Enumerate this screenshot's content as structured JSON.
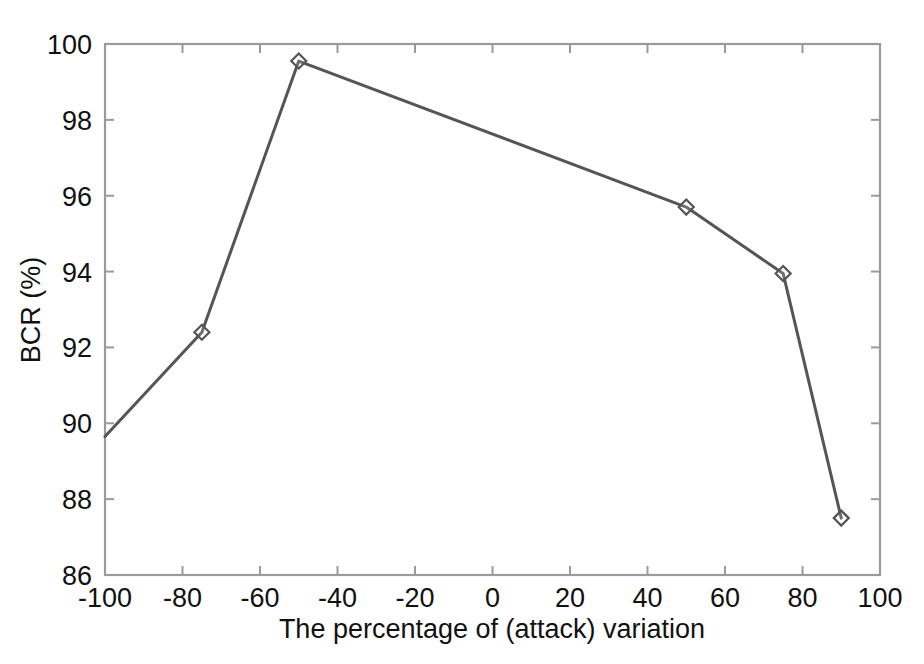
{
  "figure": {
    "background_color": "#ffffff",
    "axes_color": "#9a9a9a",
    "series_color": "#555555",
    "text_color": "#111111"
  },
  "chart_data": {
    "type": "line",
    "title": "",
    "subtitle": "",
    "xlabel": "The percentage of (attack) variation",
    "ylabel": "BCR (%)",
    "xlim": [
      -100,
      100
    ],
    "ylim": [
      86,
      100
    ],
    "xticks": [
      -100,
      -80,
      -60,
      -40,
      -20,
      0,
      20,
      40,
      60,
      80,
      100
    ],
    "xtick_labels": [
      "-100",
      "-80",
      "-60",
      "-40",
      "-20",
      "0",
      "20",
      "40",
      "60",
      "80",
      "100"
    ],
    "yticks": [
      86,
      88,
      90,
      92,
      94,
      96,
      98,
      100
    ],
    "ytick_labels": [
      "86",
      "88",
      "90",
      "92",
      "94",
      "96",
      "98",
      "100"
    ],
    "grid": false,
    "legend": null,
    "legend_position": "none",
    "marker": "diamond",
    "x": [
      -100,
      -75,
      -50,
      50,
      75,
      90
    ],
    "values": [
      89.65,
      92.4,
      99.55,
      95.7,
      93.95,
      87.5
    ],
    "series": [
      {
        "name": "BCR",
        "x": [
          -100,
          -75,
          -50,
          50,
          75,
          90
        ],
        "values": [
          89.65,
          92.4,
          99.55,
          95.7,
          93.95,
          87.5
        ]
      }
    ],
    "annotations": []
  }
}
